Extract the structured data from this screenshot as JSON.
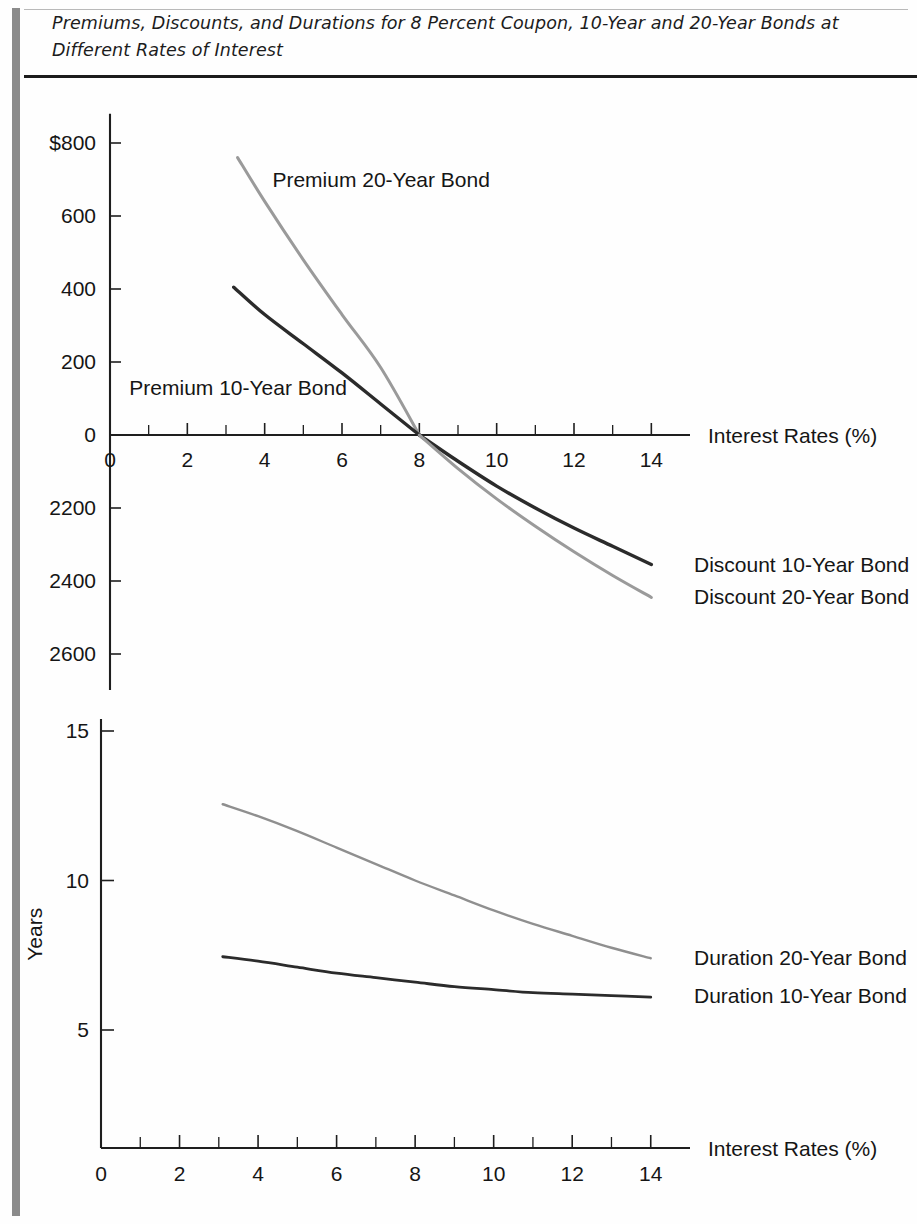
{
  "document": {
    "title_line1": "Premiums, Discounts, and Durations for 8 Percent Coupon, 10-Year and 20-Year Bonds at",
    "title_line2": "Different Rates of Interest",
    "title_full": "Premiums, Discounts, and Durations for 8 Percent Coupon, 10-Year and 20-Year Bonds at Different Rates of Interest"
  },
  "colors": {
    "dark_series": "#2b2b2b",
    "gray_series": "#9a9a9a",
    "axis": "#1e1e1e",
    "rule": "#1c1c1c",
    "margin_bar": "#8b8b8b",
    "text": "#151515",
    "background": "#fefefe"
  },
  "chart_data": [
    {
      "id": "premium-discount-chart",
      "type": "line",
      "title": "",
      "xlabel": "Interest Rates (%)",
      "ylabel": "",
      "xlim": [
        0,
        15
      ],
      "ylim": [
        -700,
        800
      ],
      "grid": false,
      "legend": "inline-labels",
      "xticks": [
        0,
        2,
        4,
        6,
        8,
        10,
        12,
        14
      ],
      "xtick_labels": [
        "0",
        "2",
        "4",
        "6",
        "8",
        "10",
        "12",
        "14"
      ],
      "xminor_ticks": [
        1,
        3,
        5,
        7,
        9,
        11,
        13
      ],
      "yticks": [
        800,
        600,
        400,
        200,
        0,
        -200,
        -400,
        -600
      ],
      "ytick_labels": [
        "$800",
        "600",
        "400",
        "200",
        "0",
        "2200",
        "2400",
        "2600"
      ],
      "series": [
        {
          "name": "Premium 20-Year Bond",
          "color": "#9a9a9a",
          "label_x": 4.2,
          "label_y": 680,
          "x": [
            3.3,
            4.0,
            5.0,
            6.0,
            7.0,
            8.0
          ],
          "values": [
            760,
            640,
            480,
            330,
            185,
            0
          ]
        },
        {
          "name": "Premium 10-Year Bond",
          "color": "#2b2b2b",
          "label_x": 0.5,
          "label_y": 110,
          "x": [
            3.2,
            4.0,
            5.0,
            6.0,
            7.0,
            8.0
          ],
          "values": [
            405,
            330,
            250,
            170,
            85,
            0
          ]
        },
        {
          "name": "Discount 10-Year Bond",
          "color": "#2b2b2b",
          "label_x": 14.8,
          "label_y": -355,
          "x": [
            8.0,
            9.0,
            10.0,
            11.0,
            12.0,
            13.0,
            14.0
          ],
          "values": [
            0,
            -72,
            -140,
            -200,
            -255,
            -305,
            -355
          ]
        },
        {
          "name": "Discount 20-Year Bond",
          "color": "#9a9a9a",
          "label_x": 14.8,
          "label_y": -445,
          "x": [
            8.0,
            9.0,
            10.0,
            11.0,
            12.0,
            13.0,
            14.0
          ],
          "values": [
            0,
            -92,
            -175,
            -250,
            -320,
            -385,
            -445
          ]
        }
      ]
    },
    {
      "id": "duration-chart",
      "type": "line",
      "title": "",
      "xlabel": "Interest Rates (%)",
      "ylabel": "Years",
      "xlim": [
        0,
        15
      ],
      "ylim": [
        0,
        16
      ],
      "grid": false,
      "legend": "inline-labels",
      "xticks": [
        0,
        2,
        4,
        6,
        8,
        10,
        12,
        14
      ],
      "xtick_labels": [
        "0",
        "2",
        "4",
        "6",
        "8",
        "10",
        "12",
        "14"
      ],
      "xminor_ticks": [
        1,
        3,
        5,
        7,
        9,
        11,
        13
      ],
      "yticks": [
        15,
        10,
        5
      ],
      "ytick_labels": [
        "15",
        "10",
        "5"
      ],
      "series": [
        {
          "name": "Duration 20-Year Bond",
          "color": "#9a9a9a",
          "label_x": 14.6,
          "label_y": 7.4,
          "x": [
            3.1,
            4.0,
            5.0,
            6.0,
            7.0,
            8.0,
            9.0,
            10.0,
            11.0,
            12.0,
            13.0,
            14.0
          ],
          "values": [
            12.55,
            12.15,
            11.65,
            11.1,
            10.55,
            10.0,
            9.5,
            9.0,
            8.55,
            8.15,
            7.75,
            7.4
          ]
        },
        {
          "name": "Duration 10-Year Bond",
          "color": "#2b2b2b",
          "label_x": 14.6,
          "label_y": 6.15,
          "x": [
            3.1,
            4.0,
            5.0,
            6.0,
            7.0,
            8.0,
            9.0,
            10.0,
            11.0,
            12.0,
            13.0,
            14.0
          ],
          "values": [
            7.45,
            7.3,
            7.1,
            6.9,
            6.75,
            6.6,
            6.45,
            6.35,
            6.25,
            6.2,
            6.15,
            6.1
          ]
        }
      ]
    }
  ]
}
